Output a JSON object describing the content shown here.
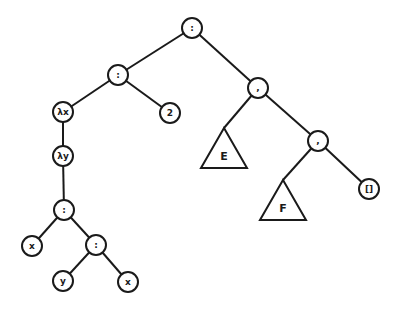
{
  "diagram": {
    "type": "syntax-tree",
    "node_radius": 10,
    "stroke_color": "#1a1a1a",
    "background": "#ffffff",
    "nodes": [
      {
        "id": "root",
        "label": ":",
        "shape": "circle",
        "x": 192,
        "y": 28
      },
      {
        "id": "cons1",
        "label": ":",
        "shape": "circle",
        "x": 118,
        "y": 75
      },
      {
        "id": "lamx",
        "label": "λx",
        "shape": "circle",
        "x": 63,
        "y": 112
      },
      {
        "id": "two",
        "label": "2",
        "shape": "circle",
        "x": 170,
        "y": 113
      },
      {
        "id": "lamy",
        "label": "λy",
        "shape": "circle",
        "x": 63,
        "y": 156
      },
      {
        "id": "cons2",
        "label": ":",
        "shape": "circle",
        "x": 64,
        "y": 210
      },
      {
        "id": "x1",
        "label": "x",
        "shape": "circle",
        "x": 32,
        "y": 246
      },
      {
        "id": "cons3",
        "label": ":",
        "shape": "circle",
        "x": 96,
        "y": 245
      },
      {
        "id": "y1",
        "label": "y",
        "shape": "circle",
        "x": 63,
        "y": 281
      },
      {
        "id": "x2",
        "label": "x",
        "shape": "circle",
        "x": 128,
        "y": 282
      },
      {
        "id": "comma1",
        "label": ",",
        "shape": "circle",
        "x": 258,
        "y": 88
      },
      {
        "id": "E",
        "label": "E",
        "shape": "triangle",
        "apex_x": 224,
        "apex_y": 128,
        "base_y": 168,
        "half_width": 23
      },
      {
        "id": "comma2",
        "label": ",",
        "shape": "circle",
        "x": 318,
        "y": 141
      },
      {
        "id": "F",
        "label": "F",
        "shape": "triangle",
        "apex_x": 283,
        "apex_y": 180,
        "base_y": 220,
        "half_width": 23
      },
      {
        "id": "nil",
        "label": "[]",
        "shape": "circle",
        "x": 369,
        "y": 189
      }
    ],
    "edges": [
      {
        "from": "root",
        "to": "cons1"
      },
      {
        "from": "root",
        "to": "comma1"
      },
      {
        "from": "cons1",
        "to": "lamx"
      },
      {
        "from": "cons1",
        "to": "two"
      },
      {
        "from": "lamx",
        "to": "lamy"
      },
      {
        "from": "lamy",
        "to": "cons2"
      },
      {
        "from": "cons2",
        "to": "x1"
      },
      {
        "from": "cons2",
        "to": "cons3"
      },
      {
        "from": "cons3",
        "to": "y1"
      },
      {
        "from": "cons3",
        "to": "x2"
      },
      {
        "from": "comma1",
        "to": "E"
      },
      {
        "from": "comma1",
        "to": "comma2"
      },
      {
        "from": "comma2",
        "to": "F"
      },
      {
        "from": "comma2",
        "to": "nil"
      }
    ]
  }
}
